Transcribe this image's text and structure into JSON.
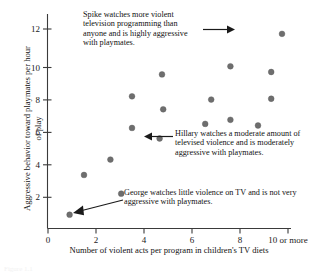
{
  "figure": {
    "caption_fragment": "Figure 1.1"
  },
  "chart_data": {
    "type": "scatter",
    "title": "",
    "xlabel": "Number of violent acts per program in children's TV diets",
    "ylabel": "Aggressive behavior toward playmates per hour of play",
    "xlim": [
      0,
      10
    ],
    "ylim": [
      0,
      12.8
    ],
    "grid": false,
    "legend": null,
    "xticks": [
      0,
      2,
      4,
      6,
      8,
      10
    ],
    "xticklabels": [
      "0",
      "2",
      "4",
      "6",
      "8",
      "10 or more"
    ],
    "yticks": [
      2,
      4,
      6,
      8,
      10,
      12
    ],
    "yticklabels": [
      "2",
      "4",
      "6",
      "8",
      "10",
      "12"
    ],
    "marker_color": "#6e6e6e",
    "axis_color": "#3a3a3a",
    "points": [
      {
        "x": 0.9,
        "y": 0.85,
        "name": "George"
      },
      {
        "x": 1.5,
        "y": 3.3
      },
      {
        "x": 2.6,
        "y": 4.25
      },
      {
        "x": 3.05,
        "y": 2.15
      },
      {
        "x": 3.5,
        "y": 8.15
      },
      {
        "x": 3.5,
        "y": 6.2
      },
      {
        "x": 4.65,
        "y": 5.55,
        "name": "Hillary"
      },
      {
        "x": 4.75,
        "y": 9.5
      },
      {
        "x": 4.8,
        "y": 7.35
      },
      {
        "x": 6.55,
        "y": 6.45
      },
      {
        "x": 6.8,
        "y": 7.95
      },
      {
        "x": 7.6,
        "y": 10.0
      },
      {
        "x": 7.6,
        "y": 6.7
      },
      {
        "x": 8.75,
        "y": 6.35
      },
      {
        "x": 9.3,
        "y": 9.65
      },
      {
        "x": 9.3,
        "y": 8.0
      },
      {
        "x": 9.75,
        "y": 12.0,
        "name": "Spike"
      }
    ],
    "annotations": [
      {
        "id": "spike",
        "text": "Spike watches more violent television programming than anyone and is highly aggressive with playmates.",
        "target": {
          "x": 9.75,
          "y": 12.0
        },
        "direction": "right"
      },
      {
        "id": "hillary",
        "text": "Hillary watches a moderate amount of televised violence and is moderately aggressive with playmates.",
        "target": {
          "x": 4.65,
          "y": 5.55
        },
        "direction": "left"
      },
      {
        "id": "george",
        "text": "George watches little violence on TV and is not very aggressive with playmates.",
        "target": {
          "x": 0.9,
          "y": 0.85
        },
        "direction": "left-down"
      }
    ]
  }
}
